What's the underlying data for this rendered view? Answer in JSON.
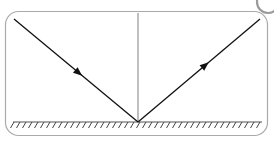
{
  "figure": {
    "canvas": {
      "width": 274,
      "height": 141,
      "background": "#ffffff"
    },
    "frame": {
      "label": "rounded-rectangle-border",
      "x": 5.5,
      "y": 11.5,
      "width": 262,
      "height": 124,
      "radius": 13,
      "stroke": "#aaaaaa",
      "stroke_width": 1.2
    },
    "surface": {
      "label": "reflecting-surface-ground-line",
      "x1": 13,
      "y1": 122,
      "x2": 262,
      "y2": 122,
      "stroke": "#555555",
      "stroke_width": 1.2,
      "hatching": {
        "label": "hatch-marks",
        "count": 42,
        "spacing": 6,
        "start_x": 14,
        "length": 7,
        "dx": 3.5,
        "dy": 6,
        "stroke": "#444444",
        "stroke_width": 1
      }
    },
    "normal": {
      "label": "normal-line",
      "x1": 138,
      "y1": 13,
      "x2": 138,
      "y2": 122,
      "stroke": "#8a8a8a",
      "stroke_width": 1.1
    },
    "incident_ray": {
      "label": "incident-ray",
      "x1": 14,
      "y1": 19,
      "x2": 138,
      "y2": 122,
      "stroke": "#111111",
      "stroke_width": 1.3,
      "arrow": {
        "label": "arrowhead-down-right",
        "position_fraction": 0.55,
        "size": 9,
        "fill": "#111111"
      }
    },
    "reflected_ray": {
      "label": "reflected-ray",
      "x1": 138,
      "y1": 122,
      "x2": 260,
      "y2": 19,
      "stroke": "#111111",
      "stroke_width": 1.3,
      "arrow": {
        "label": "arrowhead-up-right",
        "position_fraction": 0.58,
        "size": 9,
        "fill": "#111111"
      }
    },
    "corner_artifact": {
      "label": "scan-artifact-arc",
      "cx": 268,
      "cy": 2,
      "r": 11,
      "stroke": "#9a9a9a",
      "stroke_width": 2.2
    }
  }
}
